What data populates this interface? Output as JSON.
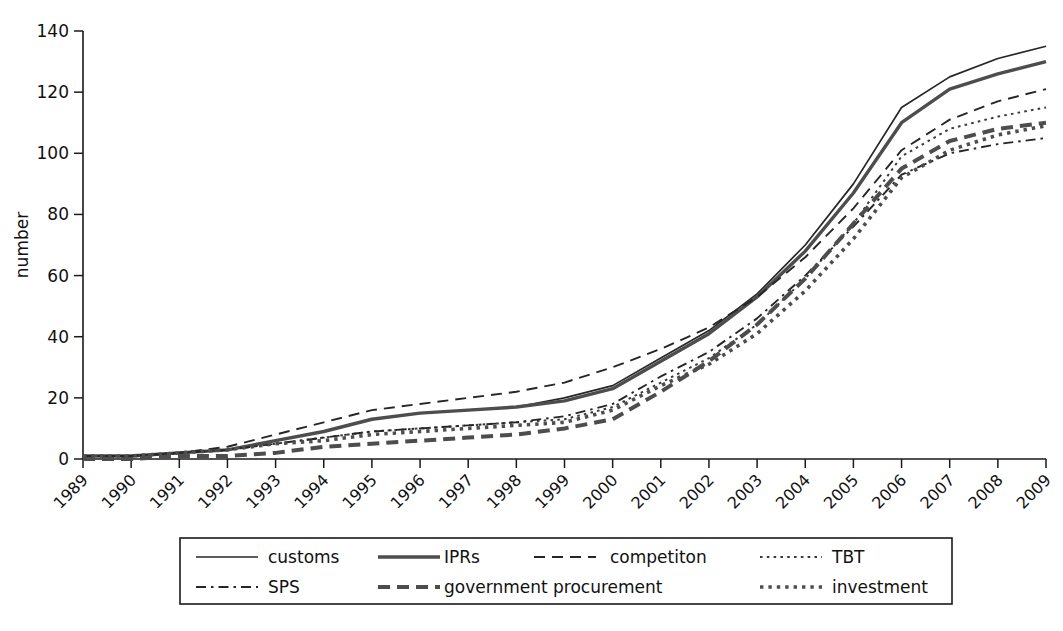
{
  "chart_data": {
    "type": "line",
    "title": "",
    "subtitle": "",
    "xlabel": "",
    "ylabel": "number",
    "x": [
      "1989",
      "1990",
      "1991",
      "1992",
      "1993",
      "1994",
      "1995",
      "1996",
      "1997",
      "1998",
      "1999",
      "2000",
      "2001",
      "2002",
      "2003",
      "2004",
      "2005",
      "2006",
      "2007",
      "2008",
      "2009"
    ],
    "ylim": [
      0,
      140
    ],
    "yticks": [
      0,
      20,
      40,
      60,
      80,
      100,
      120,
      140
    ],
    "grid": false,
    "legend_position": "bottom",
    "series": [
      {
        "name": "customs",
        "style": "solid-thin",
        "color": "#262626",
        "values": [
          1,
          1,
          2,
          3,
          6,
          9,
          13,
          15,
          16,
          17,
          20,
          24,
          33,
          42,
          54,
          70,
          90,
          115,
          125,
          131,
          135
        ]
      },
      {
        "name": "IPRs",
        "style": "solid-thick",
        "color": "#4d4d4d",
        "values": [
          1,
          1,
          2,
          3,
          6,
          9,
          13,
          15,
          16,
          17,
          19,
          23,
          32,
          41,
          53,
          68,
          87,
          110,
          121,
          126,
          130
        ]
      },
      {
        "name": "competiton",
        "style": "dashed",
        "color": "#262626",
        "values": [
          1,
          1,
          2,
          4,
          8,
          12,
          16,
          18,
          20,
          22,
          25,
          30,
          36,
          43,
          53,
          66,
          82,
          101,
          111,
          117,
          121
        ]
      },
      {
        "name": "TBT",
        "style": "dotted-fine",
        "color": "#3a3a3a",
        "values": [
          1,
          1,
          2,
          3,
          5,
          7,
          9,
          10,
          11,
          12,
          13,
          17,
          25,
          33,
          44,
          59,
          77,
          99,
          108,
          112,
          115
        ]
      },
      {
        "name": "SPS",
        "style": "dash-dot",
        "color": "#262626",
        "values": [
          1,
          1,
          2,
          3,
          5,
          7,
          9,
          10,
          11,
          12,
          14,
          18,
          27,
          35,
          46,
          60,
          76,
          93,
          100,
          103,
          105
        ]
      },
      {
        "name": "government procurement",
        "style": "dashed-thick",
        "color": "#4d4d4d",
        "values": [
          0,
          0,
          1,
          1,
          2,
          4,
          5,
          6,
          7,
          8,
          10,
          13,
          22,
          32,
          44,
          59,
          77,
          95,
          104,
          108,
          110
        ]
      },
      {
        "name": "investment",
        "style": "dotted-thick",
        "color": "#4d4d4d",
        "values": [
          1,
          1,
          2,
          3,
          5,
          6,
          8,
          9,
          10,
          11,
          12,
          16,
          24,
          31,
          41,
          55,
          72,
          92,
          101,
          106,
          109
        ]
      }
    ]
  },
  "axes": {
    "ylabel": "number",
    "ytick_labels": [
      "0",
      "20",
      "40",
      "60",
      "80",
      "100",
      "120",
      "140"
    ],
    "xtick_labels": [
      "1989",
      "1990",
      "1991",
      "1992",
      "1993",
      "1994",
      "1995",
      "1996",
      "1997",
      "1998",
      "1999",
      "2000",
      "2001",
      "2002",
      "2003",
      "2004",
      "2005",
      "2006",
      "2007",
      "2008",
      "2009"
    ]
  },
  "legend": {
    "entries": [
      {
        "label": "customs",
        "style": "solid-thin"
      },
      {
        "label": "IPRs",
        "style": "solid-thick"
      },
      {
        "label": "competiton",
        "style": "dashed"
      },
      {
        "label": "TBT",
        "style": "dotted-fine"
      },
      {
        "label": "SPS",
        "style": "dash-dot"
      },
      {
        "label": "government procurement",
        "style": "dashed-thick"
      },
      {
        "label": "investment",
        "style": "dotted-thick"
      }
    ]
  },
  "colors": {
    "axis": "#1a1a1a",
    "ink_dark": "#262626",
    "ink_grey": "#4d4d4d",
    "background": "#ffffff"
  }
}
